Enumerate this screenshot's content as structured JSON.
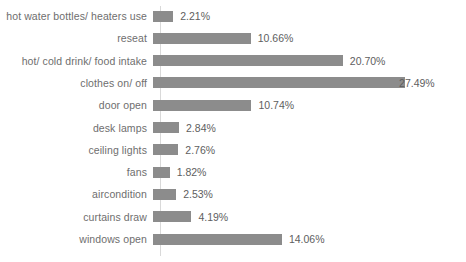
{
  "chart_data": {
    "type": "bar",
    "orientation": "horizontal",
    "title": "",
    "xlabel": "",
    "ylabel": "",
    "grid": false,
    "legend": false,
    "xlim": [
      0,
      30
    ],
    "categories": [
      "hot water bottles/ heaters use",
      "reseat",
      "hot/ cold drink/ food intake",
      "clothes on/ off",
      "door open",
      "desk lamps",
      "ceiling lights",
      "fans",
      "aircondition",
      "curtains draw",
      "windows open"
    ],
    "values": [
      2.21,
      10.66,
      20.7,
      27.49,
      10.74,
      2.84,
      2.76,
      1.82,
      2.53,
      4.19,
      14.06
    ],
    "value_labels": [
      "2.21%",
      "10.66%",
      "20.70%",
      "27.49%",
      "10.74%",
      "2.84%",
      "2.76%",
      "1.82%",
      "2.53%",
      "4.19%",
      "14.06%"
    ],
    "bar_color": "#8c8c8c",
    "axis_color": "#d9d9d9",
    "label_color": "#6e6e6e"
  }
}
